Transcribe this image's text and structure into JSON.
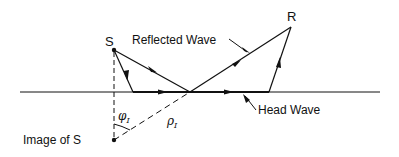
{
  "diagram": {
    "labels": {
      "source": "S",
      "receiver": "R",
      "reflected_wave": "Reflected Wave",
      "head_wave": "Head Wave",
      "image_of_source": "Image of S",
      "angle_symbol": "φ",
      "angle_subscript": "I",
      "distance_symbol": "ρ",
      "distance_subscript": "I"
    },
    "colors": {
      "ink": "#111111",
      "background": "#ffffff"
    }
  }
}
